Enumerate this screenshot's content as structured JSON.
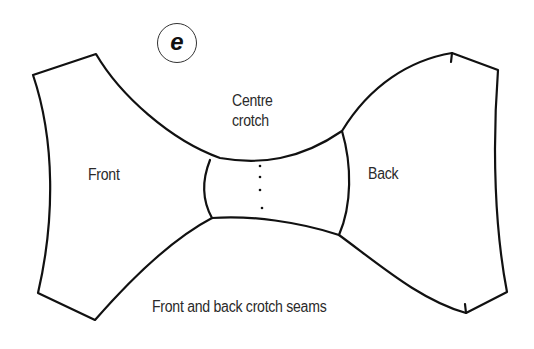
{
  "figure": {
    "badge_letter": "e",
    "labels": {
      "centre_crotch_line1": "Centre",
      "centre_crotch_line2": "crotch",
      "front": "Front",
      "back": "Back",
      "seams": "Front and back crotch seams"
    },
    "colors": {
      "stroke": "#111111",
      "text": "#2a2a2a",
      "background": "#ffffff"
    }
  }
}
